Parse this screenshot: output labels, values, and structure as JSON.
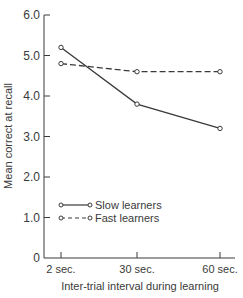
{
  "chart_data": {
    "type": "line",
    "title": "",
    "xlabel": "Inter-trial interval during learning",
    "ylabel": "Mean correct at recall",
    "categories": [
      "2 sec.",
      "30 sec.",
      "60 sec."
    ],
    "yticks": [
      "0",
      "1.0",
      "2.0",
      "3.0",
      "4.0",
      "5.0",
      "6.0"
    ],
    "ylim": [
      0,
      6.0
    ],
    "grid": false,
    "legend_position": "lower-left inside plot",
    "series": [
      {
        "name": "Slow learners",
        "style": "solid",
        "marker": "open-circle",
        "values": [
          5.2,
          3.8,
          3.2
        ]
      },
      {
        "name": "Fast learners",
        "style": "dashed",
        "marker": "open-circle",
        "values": [
          4.8,
          4.6,
          4.6
        ]
      }
    ]
  },
  "colors": {
    "line": "#3a3a3a",
    "text": "#3a3a3a",
    "background": "#ffffff"
  }
}
